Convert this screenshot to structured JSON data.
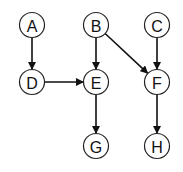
{
  "diagram": {
    "type": "directed-graph",
    "node_radius": 12.5,
    "stroke_color": "#222222",
    "nodes": [
      {
        "id": "A",
        "label": "A",
        "x": 32,
        "y": 25
      },
      {
        "id": "B",
        "label": "B",
        "x": 96,
        "y": 25
      },
      {
        "id": "C",
        "label": "C",
        "x": 157,
        "y": 25
      },
      {
        "id": "D",
        "label": "D",
        "x": 32,
        "y": 82
      },
      {
        "id": "E",
        "label": "E",
        "x": 96,
        "y": 82
      },
      {
        "id": "F",
        "label": "F",
        "x": 157,
        "y": 82
      },
      {
        "id": "G",
        "label": "G",
        "x": 96,
        "y": 146
      },
      {
        "id": "H",
        "label": "H",
        "x": 157,
        "y": 146
      }
    ],
    "edges": [
      {
        "from": "A",
        "to": "D"
      },
      {
        "from": "D",
        "to": "E"
      },
      {
        "from": "B",
        "to": "E"
      },
      {
        "from": "B",
        "to": "F"
      },
      {
        "from": "C",
        "to": "F"
      },
      {
        "from": "E",
        "to": "G"
      },
      {
        "from": "F",
        "to": "H"
      }
    ]
  }
}
